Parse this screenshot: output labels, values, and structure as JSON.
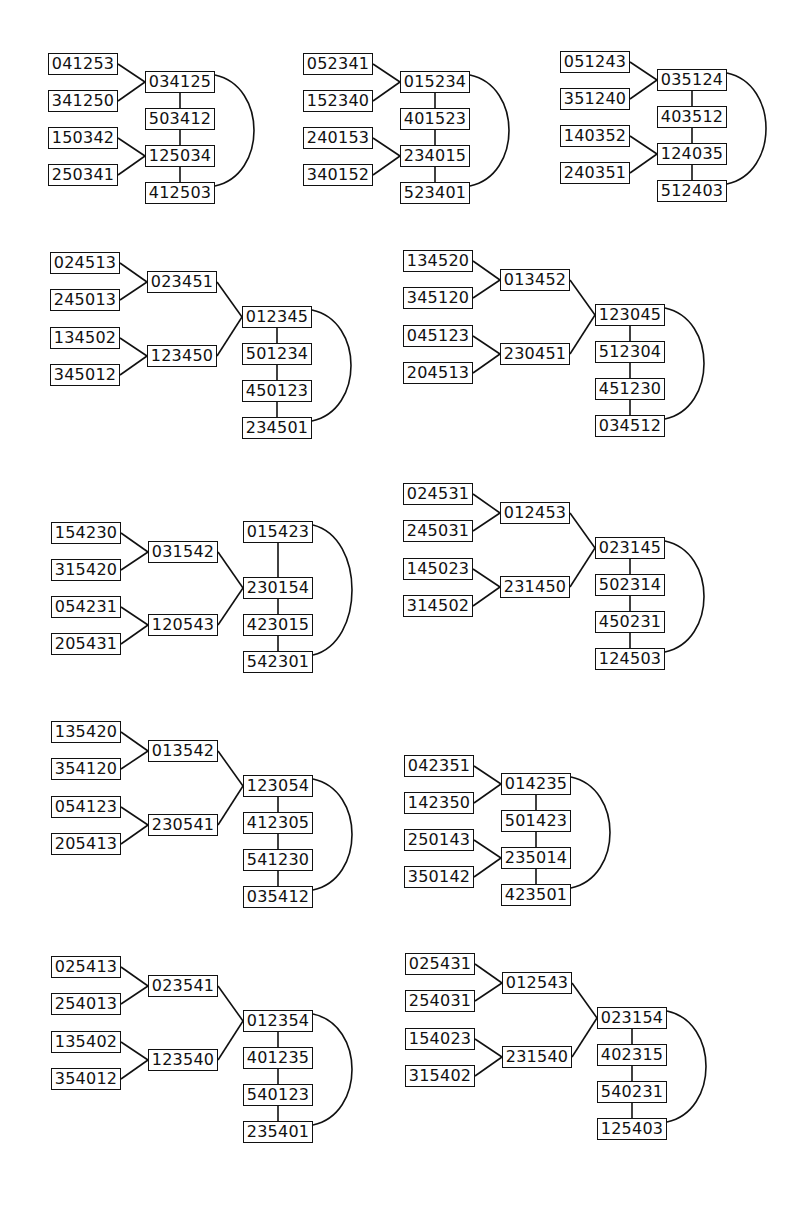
{
  "diagrams": [
    {
      "id": "d1",
      "x": 48,
      "y": 53,
      "type": "A",
      "leaves": [
        "041253",
        "341250",
        "150342",
        "250341"
      ],
      "chain": [
        "034125",
        "503412",
        "125034",
        "412503"
      ]
    },
    {
      "id": "d2",
      "x": 303,
      "y": 53,
      "type": "A",
      "leaves": [
        "052341",
        "152340",
        "240153",
        "340152"
      ],
      "chain": [
        "015234",
        "401523",
        "234015",
        "523401"
      ]
    },
    {
      "id": "d3",
      "x": 560,
      "y": 51,
      "type": "A",
      "leaves": [
        "051243",
        "351240",
        "140352",
        "240351"
      ],
      "chain": [
        "035124",
        "403512",
        "124035",
        "512403"
      ]
    },
    {
      "id": "d4",
      "x": 50,
      "y": 252,
      "type": "B",
      "leaves": [
        "024513",
        "245013",
        "134502",
        "345012"
      ],
      "mids": [
        "023451",
        "123450"
      ],
      "chain": [
        "012345",
        "501234",
        "450123",
        "234501"
      ]
    },
    {
      "id": "d5",
      "x": 403,
      "y": 250,
      "type": "B",
      "leaves": [
        "134520",
        "345120",
        "045123",
        "204513"
      ],
      "mids": [
        "013452",
        "230451"
      ],
      "chain": [
        "123045",
        "512304",
        "451230",
        "034512"
      ]
    },
    {
      "id": "d6",
      "x": 51,
      "y": 522,
      "type": "C",
      "leaves": [
        "154230",
        "315420",
        "054231",
        "205431"
      ],
      "mids": [
        "031542",
        "120543"
      ],
      "chain": [
        "015423",
        "230154",
        "423015",
        "542301"
      ]
    },
    {
      "id": "d7",
      "x": 403,
      "y": 483,
      "type": "B",
      "leaves": [
        "024531",
        "245031",
        "145023",
        "314502"
      ],
      "mids": [
        "012453",
        "231450"
      ],
      "chain": [
        "023145",
        "502314",
        "450231",
        "124503"
      ]
    },
    {
      "id": "d8",
      "x": 51,
      "y": 721,
      "type": "B",
      "leaves": [
        "135420",
        "354120",
        "054123",
        "205413"
      ],
      "mids": [
        "013542",
        "230541"
      ],
      "chain": [
        "123054",
        "412305",
        "541230",
        "035412"
      ]
    },
    {
      "id": "d9",
      "x": 404,
      "y": 755,
      "type": "A",
      "leaves": [
        "042351",
        "142350",
        "250143",
        "350142"
      ],
      "chain": [
        "014235",
        "501423",
        "235014",
        "423501"
      ]
    },
    {
      "id": "d10",
      "x": 51,
      "y": 956,
      "type": "B",
      "leaves": [
        "025413",
        "254013",
        "135402",
        "354012"
      ],
      "mids": [
        "023541",
        "123540"
      ],
      "chain": [
        "012354",
        "401235",
        "540123",
        "235401"
      ]
    },
    {
      "id": "d11",
      "x": 405,
      "y": 953,
      "type": "B",
      "leaves": [
        "025431",
        "254031",
        "154023",
        "315402"
      ],
      "mids": [
        "012543",
        "231540"
      ],
      "chain": [
        "023154",
        "402315",
        "540231",
        "125403"
      ]
    }
  ]
}
